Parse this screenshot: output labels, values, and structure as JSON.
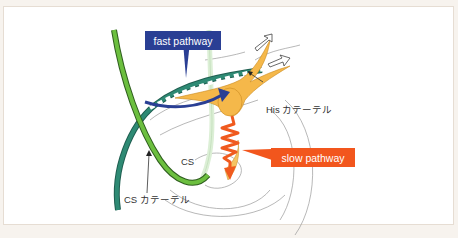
{
  "diagram": {
    "labels": {
      "fast_pathway": "fast pathway",
      "slow_pathway": "slow pathway",
      "his_catheter": "His カテーテル",
      "cs_catheter": "CS カテーテル",
      "cs": "CS"
    },
    "colors": {
      "fast_pathway_box": "#2a3f94",
      "slow_pathway_box": "#f2561d",
      "his_catheter": "#2e8a74",
      "cs_catheter_outer": "#2e7d6a",
      "cs_catheter_green": "#6cbf3f",
      "conduction_tissue": "#f5b84a",
      "slow_zigzag": "#f05a1e",
      "anatomy_lines": "#8a8a8a",
      "frame_border": "#e6ddd3"
    }
  }
}
